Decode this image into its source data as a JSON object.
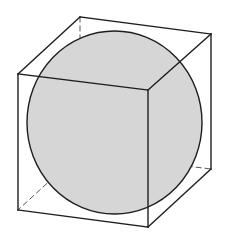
{
  "diagram": {
    "colors": {
      "background": "#ffffff",
      "sphere_fill": "#d6d6d6",
      "edge": "#1e1e1e",
      "hidden_edge": "#555555"
    },
    "sphere": {
      "cx": 114.5,
      "cy": 122.5,
      "rx": 87.5,
      "ry": 91.5
    },
    "cube": {
      "vertices": {
        "front_top_left": [
          18,
          74
        ],
        "front_top_right": [
          148,
          90
        ],
        "front_bottom_left": [
          18,
          210
        ],
        "front_bottom_right": [
          148,
          227
        ],
        "back_top_left": [
          80,
          17
        ],
        "back_top_right": [
          211,
          34
        ],
        "back_bottom_left": [
          80,
          153
        ],
        "back_bottom_right": [
          211,
          169
        ]
      },
      "visible_edges": [
        [
          "front_top_left",
          "front_top_right"
        ],
        [
          "front_top_right",
          "front_bottom_right"
        ],
        [
          "front_bottom_right",
          "front_bottom_left"
        ],
        [
          "front_bottom_left",
          "front_top_left"
        ],
        [
          "front_top_left",
          "back_top_left"
        ],
        [
          "back_top_left",
          "back_top_right"
        ],
        [
          "back_top_right",
          "front_top_right"
        ],
        [
          "back_top_right",
          "back_bottom_right"
        ],
        [
          "back_bottom_right",
          "front_bottom_right"
        ]
      ],
      "hidden_edges": [
        [
          "back_top_left",
          "back_bottom_left"
        ],
        [
          "back_bottom_left",
          "front_bottom_left"
        ],
        [
          "back_bottom_left",
          "back_bottom_right"
        ]
      ]
    }
  }
}
